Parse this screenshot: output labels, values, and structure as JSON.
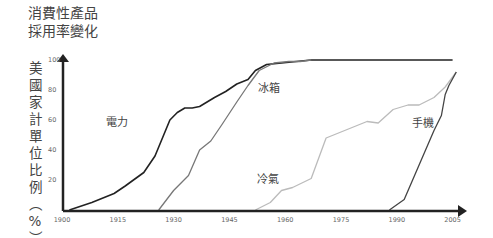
{
  "title_lines": [
    "消費性產品",
    "採用率變化"
  ],
  "ylabel_chars": [
    "美",
    "國",
    "家",
    "計",
    "單",
    "位",
    "比",
    "例",
    "︵",
    "%",
    "︶"
  ],
  "chart_data": {
    "type": "line",
    "xlabel": "",
    "ylabel": "美國家計單位比例（%）",
    "x_ticks": [
      1900,
      1915,
      1930,
      1945,
      1960,
      1975,
      1990,
      2005
    ],
    "y_ticks": [
      20,
      40,
      60,
      80,
      100
    ],
    "xlim": [
      1900,
      2007
    ],
    "ylim": [
      0,
      100
    ],
    "grid": false,
    "legend": "inline labels",
    "series": [
      {
        "name": "電力",
        "color": "#222222",
        "x": [
          1902,
          1908,
          1914,
          1917,
          1922,
          1925,
          1929,
          1931,
          1933,
          1935,
          1937,
          1941,
          1944,
          1947,
          1950,
          1952,
          1955,
          1959,
          1963,
          1967,
          2005
        ],
        "y": [
          0,
          5,
          11,
          16,
          25,
          36,
          60,
          65,
          68,
          68,
          69,
          75,
          79,
          84,
          87,
          93,
          97,
          98,
          99,
          100,
          100
        ]
      },
      {
        "name": "冰箱",
        "color": "#777777",
        "x": [
          1926,
          1930,
          1934,
          1937,
          1940,
          1943,
          1947,
          1950,
          1953,
          1957,
          1961,
          1964,
          1967
        ],
        "y": [
          0,
          13,
          23,
          40,
          46,
          57,
          72,
          83,
          93,
          98,
          99,
          99,
          100
        ]
      },
      {
        "name": "冷氣",
        "color": "#bbbbbb",
        "x": [
          1952,
          1956,
          1959,
          1962,
          1967,
          1971,
          1976,
          1982,
          1985,
          1989,
          1993,
          1996,
          2000,
          2003,
          2006
        ],
        "y": [
          0,
          5,
          13,
          15,
          21,
          48,
          53,
          59,
          58,
          67,
          70,
          70,
          75,
          82,
          92
        ]
      },
      {
        "name": "手機",
        "color": "#444444",
        "x": [
          1988,
          1992,
          1996,
          2000,
          2002,
          2003,
          2004,
          2006
        ],
        "y": [
          0,
          7,
          30,
          53,
          63,
          77,
          83,
          92
        ]
      }
    ]
  },
  "series_labels": [
    {
      "text": "電力",
      "x": 106,
      "y": 126
    },
    {
      "text": "冰箱",
      "x": 258,
      "y": 92
    },
    {
      "text": "冷氣",
      "x": 257,
      "y": 183
    },
    {
      "text": "手機",
      "x": 412,
      "y": 127
    }
  ]
}
